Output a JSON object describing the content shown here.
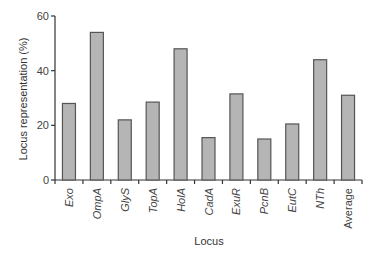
{
  "chart_data": {
    "type": "bar",
    "title": "",
    "xlabel": "Locus",
    "ylabel": "Locus representation (%)",
    "ylim": [
      0,
      60
    ],
    "yticks": [
      0,
      20,
      40,
      60
    ],
    "grid": false,
    "legend": null,
    "categories": [
      "Exo",
      "OmpA",
      "GlyS",
      "TopA",
      "HolA",
      "CadA",
      "ExuR",
      "PcnB",
      "EutC",
      "NTh",
      "Average"
    ],
    "italic_categories": [
      "Exo",
      "OmpA",
      "GlyS",
      "TopA",
      "HolA",
      "CadA",
      "ExuR",
      "PcnB",
      "EutC",
      "NTh"
    ],
    "values": [
      28,
      54,
      22,
      28.5,
      48,
      15.5,
      31.5,
      15,
      20.5,
      44,
      31
    ]
  },
  "colors": {
    "bar_fill": "#b5b5b5",
    "bar_stroke": "#555555",
    "axis": "#333333"
  }
}
